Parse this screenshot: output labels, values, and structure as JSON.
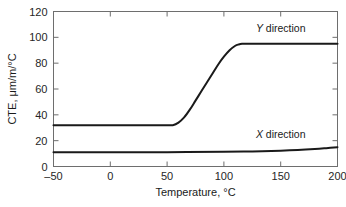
{
  "chart_data": {
    "type": "line",
    "title": "",
    "xlabel": "Temperature, °C",
    "ylabel": "CTE, μm/m/°C",
    "xlim": [
      -50,
      200
    ],
    "ylim": [
      0,
      120
    ],
    "xticks": [
      -50,
      0,
      50,
      100,
      150,
      200
    ],
    "xticklabels": [
      "–50",
      "0",
      "50",
      "100",
      "150",
      "200"
    ],
    "yticks": [
      0,
      20,
      40,
      60,
      80,
      100,
      120
    ],
    "yticklabels": [
      "0",
      "20",
      "40",
      "60",
      "80",
      "100",
      "120"
    ],
    "grid": false,
    "legend": "inline-annotations",
    "series": [
      {
        "name": "Y direction",
        "label_prefix": "Y",
        "label_suffix": " direction",
        "color": "#1a1a1a",
        "x": [
          -50,
          -30,
          -10,
          10,
          30,
          50,
          55,
          60,
          65,
          70,
          75,
          80,
          85,
          90,
          95,
          100,
          105,
          110,
          113,
          116,
          120,
          130,
          150,
          175,
          200
        ],
        "y": [
          32,
          32,
          32,
          32,
          32,
          32,
          32,
          34,
          38,
          44,
          51,
          58,
          65,
          72,
          79,
          85,
          90,
          93.5,
          94.5,
          95,
          95,
          95,
          95,
          95,
          95
        ]
      },
      {
        "name": "X direction",
        "label_prefix": "X",
        "label_suffix": " direction",
        "color": "#1a1a1a",
        "x": [
          -50,
          0,
          50,
          100,
          125,
          150,
          165,
          180,
          190,
          200
        ],
        "y": [
          11,
          11,
          11.1,
          11.4,
          11.7,
          12.2,
          12.7,
          13.5,
          14.2,
          15
        ]
      }
    ],
    "annotations": [
      {
        "text_prefix": "Y",
        "text_suffix": " direction",
        "x": 150,
        "y": 104
      },
      {
        "text_prefix": "X",
        "text_suffix": " direction",
        "x": 150,
        "y": 22
      }
    ]
  }
}
